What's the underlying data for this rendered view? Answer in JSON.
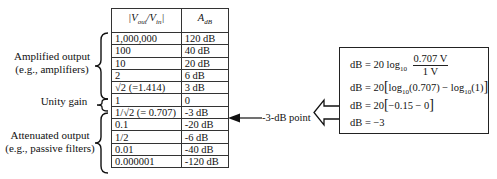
{
  "table": {
    "headers": {
      "ratio": "|Vout/Vin|",
      "ratio_main_v1": "V",
      "ratio_sub1": "out",
      "ratio_sep": "/V",
      "ratio_sub2": "in",
      "adb_main": "A",
      "adb_sub": "dB"
    },
    "rows": [
      {
        "ratio": "1,000,000",
        "db": "120 dB"
      },
      {
        "ratio": "100",
        "db": "40 dB"
      },
      {
        "ratio": "10",
        "db": "20 dB"
      },
      {
        "ratio": "2",
        "db": "6 dB"
      },
      {
        "ratio": "√2 (=1.414)",
        "db": "3 dB"
      },
      {
        "ratio": "1",
        "db": "0"
      },
      {
        "ratio": "1/√2 (= 0.707)",
        "db": "-3 dB"
      },
      {
        "ratio": "0.1",
        "db": "-20 dB"
      },
      {
        "ratio": "1/2",
        "db": "-6 dB"
      },
      {
        "ratio": "0.01",
        "db": "-40 dB"
      },
      {
        "ratio": "0.000001",
        "db": "-120 dB"
      }
    ]
  },
  "groups": {
    "amplified": {
      "line1": "Amplified output",
      "line2": "(e.g., amplifiers)"
    },
    "unity": {
      "label": "Unity gain"
    },
    "attenuated": {
      "line1": "Attenuated output",
      "line2": "(e.g., passive filters)"
    }
  },
  "annotation": {
    "label": "-3-dB point"
  },
  "formula": {
    "line1_prefix": "dB = 20 log",
    "line1_sub": "10",
    "line1_num": "0.707 V",
    "line1_den": "1 V",
    "line2_a": "dB = 20",
    "line2_b": "log",
    "line2_sub1": "10",
    "line2_c": "(0.707) − log",
    "line2_sub2": "10",
    "line2_d": "(1)",
    "line3_a": "dB = 20",
    "line3_b": "−0.15 − 0",
    "line4": "dB = −3"
  }
}
